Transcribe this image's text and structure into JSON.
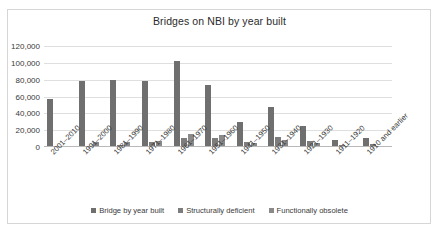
{
  "chart_data": {
    "type": "bar",
    "title": "Bridges on NBI by year built",
    "xlabel": "",
    "ylabel": "",
    "ylim": [
      0,
      120000
    ],
    "yticks": [
      0,
      20000,
      40000,
      60000,
      80000,
      100000,
      120000
    ],
    "ytick_labels": [
      "0",
      "20,000",
      "40,000",
      "60,000",
      "80,000",
      "100,000",
      "120,000"
    ],
    "grid": true,
    "legend_position": "bottom",
    "categories": [
      "2001–2010",
      "1991–2000",
      "1981–1990",
      "1971–1980",
      "1961–1970",
      "1951–1960",
      "1941–1950",
      "1931–1940",
      "1921–1930",
      "1911–1920",
      "1910 and earlier"
    ],
    "series": [
      {
        "name": "Bridge by year built",
        "color": "#6f6f6f",
        "values": [
          57500,
          79000,
          79500,
          79000,
          102000,
          74000,
          30000,
          47000,
          25500,
          8000,
          10500
        ]
      },
      {
        "name": "Structurally deficient",
        "color": "#7d7d7d",
        "values": [
          300,
          1000,
          2500,
          6000,
          11000,
          11000,
          5500,
          12000,
          7000,
          2500,
          3000
        ]
      },
      {
        "name": "Functionally obsolete",
        "color": "#8a8a8a",
        "values": [
          200,
          6000,
          6000,
          7000,
          16000,
          14000,
          5000,
          8000,
          4500,
          1000,
          1200
        ]
      }
    ]
  },
  "legend": {
    "items": [
      {
        "label": "Bridge by year built"
      },
      {
        "label": "Structurally deficient"
      },
      {
        "label": "Functionally obsolete"
      }
    ]
  }
}
